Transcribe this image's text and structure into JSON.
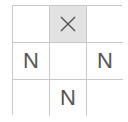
{
  "board": {
    "rows": 3,
    "cols": 3,
    "shaded_color": "#e2e2e2",
    "cells": [
      {
        "row": 0,
        "col": 0,
        "value": "",
        "shaded": false
      },
      {
        "row": 0,
        "col": 1,
        "value": "",
        "icon": "x-icon",
        "shaded": true
      },
      {
        "row": 0,
        "col": 2,
        "value": "",
        "shaded": false
      },
      {
        "row": 1,
        "col": 0,
        "value": "N",
        "shaded": false
      },
      {
        "row": 1,
        "col": 1,
        "value": "",
        "shaded": false
      },
      {
        "row": 1,
        "col": 2,
        "value": "N",
        "shaded": false
      },
      {
        "row": 2,
        "col": 0,
        "value": "",
        "shaded": false
      },
      {
        "row": 2,
        "col": 1,
        "value": "N",
        "shaded": false
      },
      {
        "row": 2,
        "col": 2,
        "value": "",
        "shaded": false
      }
    ]
  }
}
